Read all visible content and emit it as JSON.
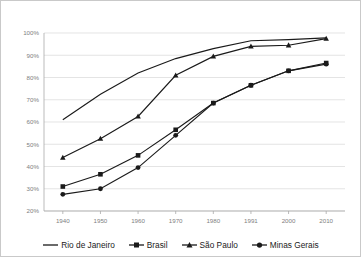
{
  "chart_data": {
    "type": "line",
    "title": "",
    "xlabel": "",
    "ylabel": "",
    "x": [
      "1940",
      "1950",
      "1960",
      "1970",
      "1980",
      "1991",
      "2000",
      "2010"
    ],
    "categories": [
      "1940",
      "1950",
      "1960",
      "1970",
      "1980",
      "1991",
      "2000",
      "2010"
    ],
    "ylim": [
      20,
      100
    ],
    "ytick_labels": [
      "100%",
      "90%",
      "80%",
      "70%",
      "60%",
      "50%",
      "40%",
      "30%",
      "20%"
    ],
    "ytick_values": [
      100,
      90,
      80,
      70,
      60,
      50,
      40,
      30,
      20
    ],
    "grid": true,
    "legend_position": "bottom",
    "series": [
      {
        "name": "Rio de Janeiro",
        "marker": "none",
        "color": "#1a1a1a",
        "values": [
          61.0,
          72.5,
          82.0,
          88.5,
          93.0,
          96.5,
          97.0,
          97.8
        ]
      },
      {
        "name": "Brasil",
        "marker": "square",
        "color": "#1a1a1a",
        "values": [
          31.0,
          36.5,
          45.0,
          56.5,
          68.5,
          76.5,
          83.0,
          86.5
        ]
      },
      {
        "name": "São Paulo",
        "marker": "triangle",
        "color": "#1a1a1a",
        "values": [
          44.0,
          52.5,
          62.5,
          81.0,
          89.5,
          94.0,
          94.5,
          97.5
        ]
      },
      {
        "name": "Minas Gerais",
        "marker": "circle",
        "color": "#1a1a1a",
        "values": [
          27.5,
          30.0,
          39.5,
          54.0,
          68.5,
          76.5,
          83.0,
          86.0
        ]
      }
    ]
  },
  "legend": {
    "items": [
      {
        "label": "Rio de Janeiro",
        "marker": "none"
      },
      {
        "label": "Brasil",
        "marker": "square"
      },
      {
        "label": "São Paulo",
        "marker": "triangle"
      },
      {
        "label": "Minas Gerais",
        "marker": "circle"
      }
    ]
  }
}
